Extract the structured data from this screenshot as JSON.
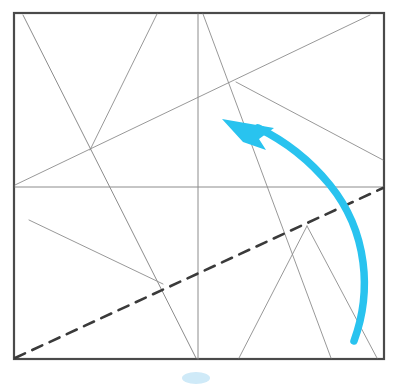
{
  "figure": {
    "type": "crease-pattern",
    "canvas": {
      "width": 402,
      "height": 384
    },
    "background_color": "#ffffff"
  },
  "colors": {
    "frame": "#4a4a4a",
    "crease": "#8c8c8c",
    "crease_dark": "#6e6e6e",
    "dashed_fold": "#3a3a3a",
    "arrow": "#29c3ef",
    "smudge": "#cfeaf8"
  },
  "frame": {
    "name": "paper-square-border",
    "x": 14,
    "y": 13,
    "width": 370,
    "height": 346,
    "stroke_width": 2.2,
    "color": "#4a4a4a"
  },
  "creases": [
    {
      "id": "c1",
      "label": "vertical-center-crease",
      "x1": 198,
      "y1": 14,
      "x2": 198,
      "y2": 359,
      "stroke_width": 1.0
    },
    {
      "id": "c2",
      "label": "horizontal-center-crease",
      "x1": 15,
      "y1": 187,
      "x2": 383,
      "y2": 187,
      "stroke_width": 1.0
    },
    {
      "id": "c3",
      "label": "top-left-descending-crease",
      "x1": 23,
      "y1": 15,
      "x2": 196,
      "y2": 358,
      "stroke_width": 1.0
    },
    {
      "id": "c4",
      "label": "upper-left-ascending-crease",
      "x1": 90,
      "y1": 150,
      "x2": 157,
      "y2": 14
    },
    {
      "id": "c5",
      "label": "left-to-upper-right-long-crease",
      "x1": 15,
      "y1": 185,
      "x2": 370,
      "y2": 15
    },
    {
      "id": "c6",
      "label": "upper-right-descending-crease",
      "x1": 203,
      "y1": 14,
      "x2": 331,
      "y2": 358
    },
    {
      "id": "c7",
      "label": "mid-right-falling-crease",
      "x1": 236,
      "y1": 82,
      "x2": 383,
      "y2": 160
    },
    {
      "id": "c8",
      "label": "lower-left-falling-crease",
      "x1": 29,
      "y1": 220,
      "x2": 163,
      "y2": 284
    },
    {
      "id": "c9",
      "label": "lower-right-rising-crease",
      "x1": 239,
      "y1": 358,
      "x2": 307,
      "y2": 226
    },
    {
      "id": "c10",
      "label": "lower-right-descending-crease",
      "x1": 307,
      "y1": 226,
      "x2": 377,
      "y2": 358
    }
  ],
  "dashed_fold_line": {
    "name": "dashed-fold-line",
    "x1": 15,
    "y1": 358,
    "x2": 383,
    "y2": 188,
    "dash_pattern": "11 8",
    "stroke_width": 2.6,
    "color": "#3a3a3a"
  },
  "fold_arrow": {
    "name": "fold-direction-arrow",
    "color": "#29c3ef",
    "stroke_width": 7.5,
    "path": "M 354 341 C 372 292, 368 232, 330 185 C 307 157, 283 140, 258 128",
    "head_points": "222,119 274,128 259,139 266,150 243,142",
    "direction": "up-left"
  },
  "smudge": {
    "name": "page-smudge",
    "cx": 196,
    "cy": 378,
    "rx": 14,
    "ry": 6,
    "color": "#cfeaf8"
  }
}
